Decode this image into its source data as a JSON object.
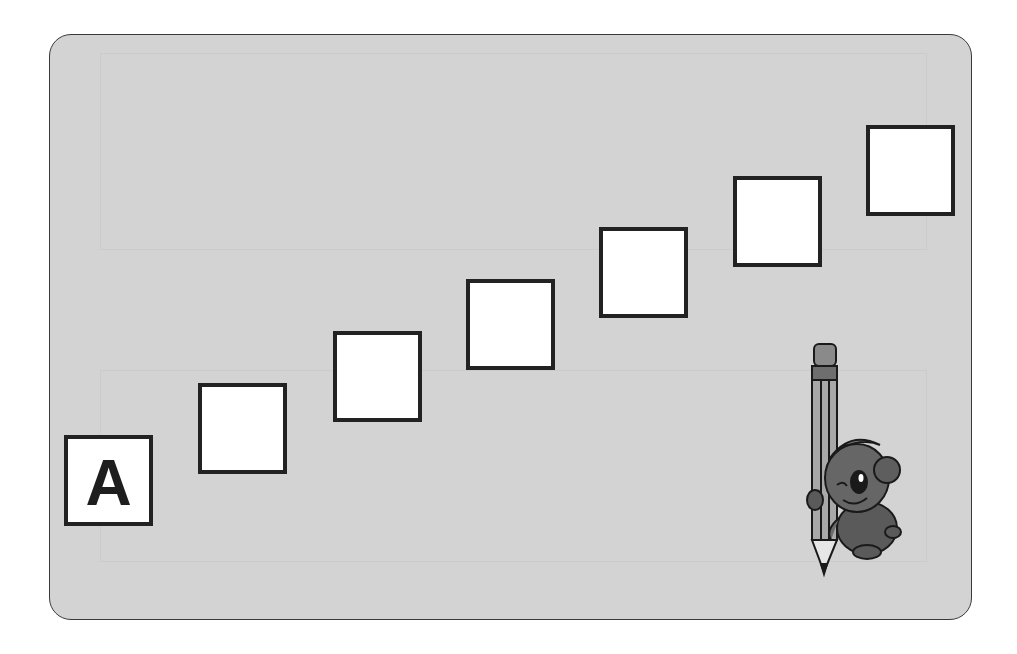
{
  "worksheet": {
    "panel_color": "#d3d3d3",
    "border_color": "#222222",
    "sequence_boxes": [
      {
        "index": 1,
        "value": "A",
        "left": 64,
        "top": 435
      },
      {
        "index": 2,
        "value": "",
        "left": 198,
        "top": 383
      },
      {
        "index": 3,
        "value": "",
        "left": 333,
        "top": 331
      },
      {
        "index": 4,
        "value": "",
        "left": 466,
        "top": 279
      },
      {
        "index": 5,
        "value": "",
        "left": 599,
        "top": 227
      },
      {
        "index": 6,
        "value": "",
        "left": 733,
        "top": 176
      },
      {
        "index": 7,
        "value": "",
        "left": 866,
        "top": 125
      }
    ],
    "mascot": {
      "icon": "bear-with-pencil-icon"
    }
  }
}
